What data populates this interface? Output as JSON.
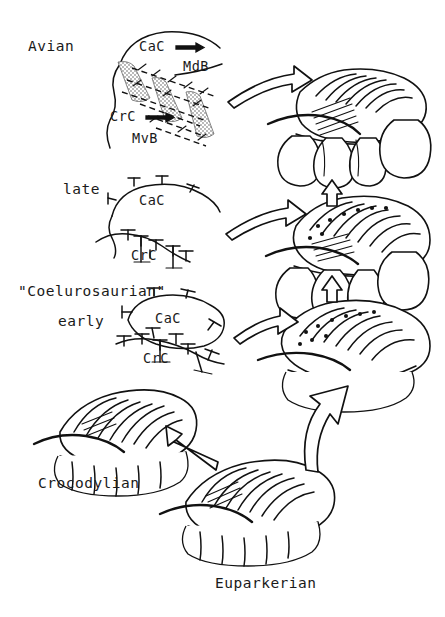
{
  "figure": {
    "title_alt": "Evolution of archosaur lung and air-sac systems",
    "rows": [
      {
        "id": "avian",
        "stage_label": "Avian",
        "anatomy_labels": [
          {
            "name": "CaC",
            "arrow": "→"
          },
          {
            "name": "MdB",
            "arrow": ""
          },
          {
            "name": "CrC",
            "arrow": "→"
          },
          {
            "name": "MvB",
            "arrow": ""
          }
        ]
      },
      {
        "id": "late",
        "stage_label": "late",
        "anatomy_labels": [
          {
            "name": "CaC",
            "arrow": ""
          },
          {
            "name": "CrC",
            "arrow": ""
          }
        ]
      },
      {
        "id": "coelurosaurian-early",
        "stage_label": "\"Coelurosaurian\"",
        "stage_sublabel": "early",
        "anatomy_labels": [
          {
            "name": "CaC",
            "arrow": ""
          },
          {
            "name": "CrC",
            "arrow": ""
          }
        ]
      },
      {
        "id": "crocodylian",
        "stage_label": "Crocodylian",
        "anatomy_labels": []
      },
      {
        "id": "euparkerian",
        "stage_label": "Euparkerian",
        "anatomy_labels": []
      }
    ],
    "labels": {
      "avian": "Avian",
      "avian_cac": "CaC",
      "avian_cac_arrow": "→",
      "avian_mdb": "MdB",
      "avian_crc": "CrC",
      "avian_crc_arrow": "→",
      "avian_mvb": "MvB",
      "late": "late",
      "late_cac": "CaC",
      "late_crc": "CrC",
      "coelurosaurian": "\"Coelurosaurian\"",
      "early": "early",
      "early_cac": "CaC",
      "early_crc": "CrC",
      "crocodylian": "Crocodylian",
      "euparkerian": "Euparkerian"
    },
    "colors": {
      "ink": "#111111",
      "paper": "#ffffff",
      "stipple": "#b9b9b9"
    },
    "arrows": {
      "transform_right_count": 3,
      "vertical_up_count": 2,
      "lineage_large_count": 2
    }
  }
}
